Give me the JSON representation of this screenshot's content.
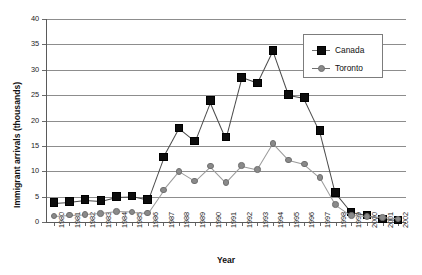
{
  "chart_data": {
    "type": "line",
    "title": "",
    "xlabel": "Year",
    "ylabel": "Immigrant arrivals (thousands)",
    "ylim": [
      0,
      40
    ],
    "ytick_step": 5,
    "yticks": [
      0,
      5,
      10,
      15,
      20,
      25,
      30,
      35,
      40
    ],
    "grid": true,
    "legend_position": "top-right",
    "categories": [
      "1980",
      "1981",
      "1982",
      "1983",
      "1984",
      "1985",
      "1986",
      "1987",
      "1988",
      "1989",
      "1990",
      "1991",
      "1992",
      "1993",
      "1994",
      "1995",
      "1996",
      "1997",
      "1998",
      "1999",
      "2000",
      "2001",
      "2002"
    ],
    "series": [
      {
        "name": "Canada",
        "marker": "square",
        "color": "#0d0d0d",
        "values": [
          3.8,
          4.0,
          4.4,
          4.2,
          5.0,
          5.1,
          4.4,
          12.8,
          18.5,
          16.0,
          23.9,
          16.7,
          28.5,
          27.4,
          33.8,
          25.1,
          24.5,
          18.0,
          5.8,
          2.0,
          1.4,
          0.6,
          0.4
        ]
      },
      {
        "name": "Toronto",
        "marker": "circle",
        "color": "#8a8a8a",
        "values": [
          1.2,
          1.4,
          1.5,
          1.7,
          2.1,
          2.0,
          1.8,
          6.3,
          10.0,
          8.1,
          11.0,
          7.8,
          11.1,
          10.4,
          15.5,
          12.2,
          11.4,
          8.8,
          3.4,
          1.3,
          1.1,
          0.9,
          0.6
        ]
      }
    ],
    "legend_entries": [
      "Canada",
      "Toronto"
    ]
  }
}
